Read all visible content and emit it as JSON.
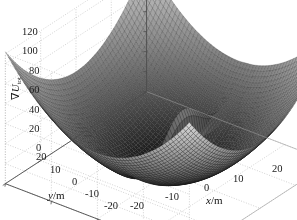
{
  "figure": {
    "type": "matlab-surface-plot",
    "background_color": "#ffffff",
    "axis_line_color": "#4d4d4d",
    "grid_color": "#b4b4b4",
    "grid_style": "dotted",
    "surface_colormap": "gray",
    "surface_light_color": "#d8d8d8",
    "surface_dark_color": "#0a0a0a",
    "mesh_line_color": "#2a2a2a"
  },
  "axes": {
    "x": {
      "label": "x/m",
      "label_variable": "x",
      "label_unit": "/m",
      "ticks": [
        "-20",
        "-10",
        "0",
        "10",
        "20"
      ],
      "values": [
        -20,
        -10,
        0,
        10,
        20
      ],
      "limits": [
        -20,
        20
      ]
    },
    "y": {
      "label": "y/m",
      "label_variable": "y",
      "label_unit": "/m",
      "ticks": [
        "20",
        "10",
        "0",
        "-10",
        "-20"
      ],
      "values": [
        20,
        10,
        0,
        -10,
        -20
      ],
      "limits": [
        -20,
        20
      ]
    },
    "z": {
      "label_nabla": "∇",
      "label_variable": "U",
      "label_subscript": "tot",
      "label_full": "∇U_tot",
      "ticks": [
        "0",
        "20",
        "40",
        "60",
        "80",
        "100",
        "120"
      ],
      "values": [
        0,
        20,
        40,
        60,
        80,
        100,
        120
      ],
      "limits": [
        0,
        130
      ]
    }
  },
  "chart_data": {
    "type": "surface",
    "title": "",
    "xlabel": "x/m",
    "ylabel": "y/m",
    "zlabel": "∇U_tot",
    "xlim": [
      -20,
      20
    ],
    "ylim": [
      -20,
      20
    ],
    "zlim": [
      0,
      130
    ],
    "xticks": [
      -20,
      -10,
      0,
      10,
      20
    ],
    "yticks": [
      -20,
      -10,
      0,
      10,
      20
    ],
    "zticks": [
      0,
      20,
      40,
      60,
      80,
      100,
      120
    ],
    "grid": true,
    "legend": "none",
    "colormap": "gray",
    "view_azimuth": -37.5,
    "view_elevation": 30,
    "mesh_resolution": 60,
    "formula": {
      "attractive": "0.5 * k_att * (x^2 + y^2)",
      "k_att": 0.33,
      "repulsive_spike": "A * exp(-((x-xo)^2/sx + (y-yo)^2/sy))",
      "repulsive_amplitude": 60,
      "obstacle_x": 1.5,
      "obstacle_y": -2.0,
      "obstacle_sigma_x": 0.9,
      "obstacle_sigma_y": 5.5
    },
    "corner_values": {
      "x_-20_y_-20": 132,
      "x_20_y_20": 132,
      "x_-20_y_20": 132,
      "x_20_y_-20": 132,
      "center_bowl_min": 0,
      "spike_peak": 62
    }
  },
  "ticklabels": {
    "z": [
      {
        "text": "120",
        "x": 22,
        "y": 27
      },
      {
        "text": "100",
        "x": 22,
        "y": 46
      },
      {
        "text": "80",
        "x": 29,
        "y": 66
      },
      {
        "text": "60",
        "x": 29,
        "y": 85
      },
      {
        "text": "40",
        "x": 29,
        "y": 105
      },
      {
        "text": "20",
        "x": 29,
        "y": 124
      },
      {
        "text": "0",
        "x": 36,
        "y": 143
      }
    ],
    "y": [
      {
        "text": "20",
        "x": 36,
        "y": 152
      },
      {
        "text": "10",
        "x": 50,
        "y": 165
      },
      {
        "text": "0",
        "x": 72,
        "y": 177
      },
      {
        "text": "-10",
        "x": 85,
        "y": 189
      },
      {
        "text": "-20",
        "x": 104,
        "y": 201
      }
    ],
    "x": [
      {
        "text": "-20",
        "x": 130,
        "y": 201
      },
      {
        "text": "-10",
        "x": 165,
        "y": 192
      },
      {
        "text": "0",
        "x": 204,
        "y": 183
      },
      {
        "text": "10",
        "x": 233,
        "y": 174
      },
      {
        "text": "20",
        "x": 272,
        "y": 164
      }
    ]
  },
  "axistitles": {
    "x": {
      "x": 206,
      "y": 195
    },
    "y": {
      "x": 48,
      "y": 190
    },
    "z": {
      "x": 10,
      "y": 100
    }
  }
}
